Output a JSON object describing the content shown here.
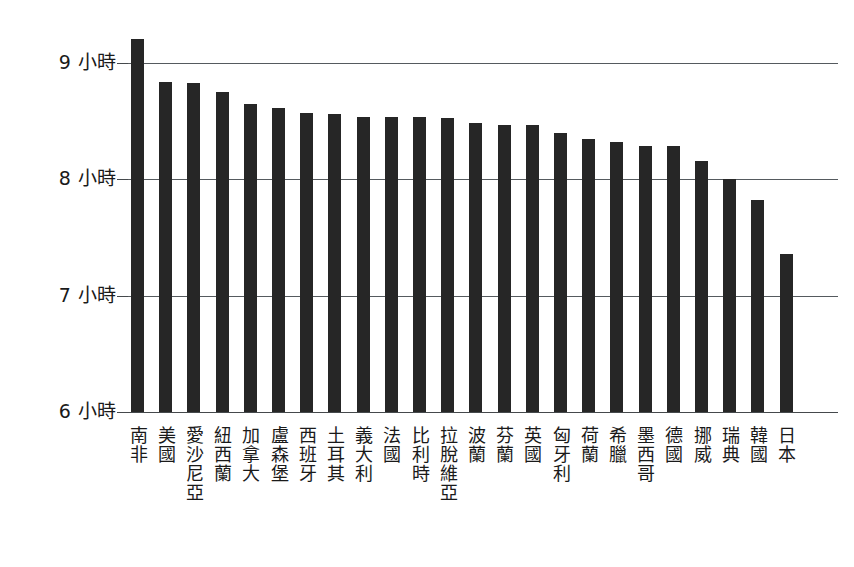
{
  "chart_data": {
    "type": "bar",
    "title": "",
    "subtitle": "",
    "xlabel": "",
    "ylabel": "",
    "ylim": [
      6,
      9.4
    ],
    "yticks": [
      6,
      7,
      8,
      9
    ],
    "ytick_labels": [
      "6 小時",
      "7 小時",
      "8 小時",
      "9 小時"
    ],
    "grid": true,
    "legend": null,
    "unit": "小時",
    "categories": [
      "南非",
      "美國",
      "愛沙尼亞",
      "紐西蘭",
      "加拿大",
      "盧森堡",
      "西班牙",
      "土耳其",
      "義大利",
      "法國",
      "比利時",
      "拉脫維亞",
      "波蘭",
      "芬蘭",
      "英國",
      "匈牙利",
      "荷蘭",
      "希臘",
      "墨西哥",
      "德國",
      "挪威",
      "瑞典",
      "韓國",
      "日本"
    ],
    "values": [
      9.21,
      8.84,
      8.83,
      8.75,
      8.65,
      8.61,
      8.57,
      8.56,
      8.54,
      8.54,
      8.54,
      8.53,
      8.48,
      8.47,
      8.47,
      8.4,
      8.35,
      8.32,
      8.29,
      8.29,
      8.16,
      8.0,
      7.82,
      7.36
    ],
    "series": [
      {
        "name": "平均睡眠時間",
        "values": [
          9.21,
          8.84,
          8.83,
          8.75,
          8.65,
          8.61,
          8.57,
          8.56,
          8.54,
          8.54,
          8.54,
          8.53,
          8.48,
          8.47,
          8.47,
          8.4,
          8.35,
          8.32,
          8.29,
          8.29,
          8.16,
          8.0,
          7.82,
          7.36
        ],
        "color": "#262626"
      }
    ]
  },
  "colors": {
    "bar": "#262626",
    "gridline": "#555a5e",
    "axis": "#45494c",
    "text": "#1a1a1a",
    "background": "#ffffff"
  }
}
